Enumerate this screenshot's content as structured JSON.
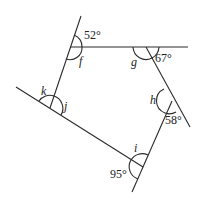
{
  "diagram": {
    "type": "pentagon-exterior-angles",
    "vertices": [
      {
        "id": "A",
        "interior_label": "f",
        "exterior_label": "52°"
      },
      {
        "id": "B",
        "interior_label": "g",
        "exterior_label": "67°"
      },
      {
        "id": "C",
        "interior_label": "h",
        "exterior_label": "58°"
      },
      {
        "id": "D",
        "interior_label": "i",
        "exterior_label": "95°"
      },
      {
        "id": "E",
        "interior_label": "j",
        "exterior_label": "k"
      }
    ],
    "labels": {
      "a52": "52°",
      "f": "f",
      "g": "g",
      "a67": "67°",
      "h": "h",
      "a58": "58°",
      "i": "i",
      "a95": "95°",
      "k": "k",
      "j": "j"
    },
    "colors": {
      "line": "#2a2a2a",
      "text": "#222222",
      "background": "#ffffff"
    }
  }
}
